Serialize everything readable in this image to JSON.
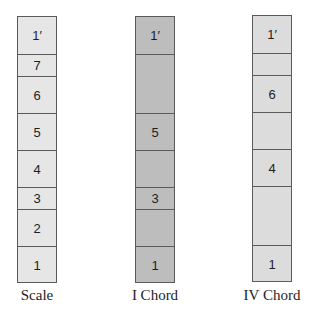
{
  "diagram": {
    "columns": [
      {
        "id": "scale",
        "label": "Scale",
        "x": 17,
        "fill": "#e6e6e6",
        "cells": [
          {
            "text": "1′",
            "top": 16,
            "bottom": 54
          },
          {
            "text": "7",
            "top": 54,
            "bottom": 76
          },
          {
            "text": "6",
            "top": 76,
            "bottom": 113
          },
          {
            "text": "5",
            "top": 113,
            "bottom": 150
          },
          {
            "text": "4",
            "top": 150,
            "bottom": 187
          },
          {
            "text": "3",
            "top": 187,
            "bottom": 209
          },
          {
            "text": "2",
            "top": 209,
            "bottom": 246
          },
          {
            "text": "1",
            "top": 246,
            "bottom": 283
          }
        ]
      },
      {
        "id": "i-chord",
        "label": "I Chord",
        "x": 135,
        "fill": "#bdbdbd",
        "cells": [
          {
            "text": "1′",
            "top": 16,
            "bottom": 54
          },
          {
            "text": "",
            "top": 54,
            "bottom": 113
          },
          {
            "text": "5",
            "top": 113,
            "bottom": 150
          },
          {
            "text": "",
            "top": 150,
            "bottom": 187
          },
          {
            "text": "3",
            "top": 187,
            "bottom": 209
          },
          {
            "text": "",
            "top": 209,
            "bottom": 246
          },
          {
            "text": "1",
            "top": 246,
            "bottom": 283
          }
        ]
      },
      {
        "id": "iv-chord",
        "label": "IV Chord",
        "x": 252,
        "fill": "#dcdcdc",
        "cells": [
          {
            "text": "1′",
            "top": 15,
            "bottom": 53
          },
          {
            "text": "",
            "top": 53,
            "bottom": 75
          },
          {
            "text": "6",
            "top": 75,
            "bottom": 112
          },
          {
            "text": "",
            "top": 112,
            "bottom": 149
          },
          {
            "text": "4",
            "top": 149,
            "bottom": 186
          },
          {
            "text": "",
            "top": 186,
            "bottom": 245
          },
          {
            "text": "1",
            "top": 245,
            "bottom": 282
          }
        ]
      }
    ],
    "colors": {
      "border": "#5a5a5a",
      "text": "#1e1e1e",
      "background": "#ffffff"
    }
  }
}
